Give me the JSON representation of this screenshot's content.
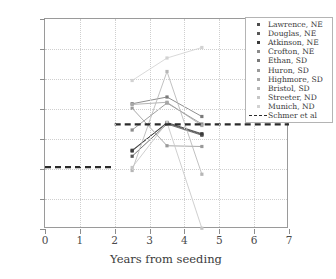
{
  "chart_data": {
    "type": "line",
    "title": "",
    "xlabel": "Years from seeding",
    "ylabel": "Harvest yield, Mg water−free/ha",
    "xlim": [
      0,
      7
    ],
    "ylim": [
      0,
      14
    ],
    "xticks": [
      "0",
      "1",
      "2",
      "3",
      "4",
      "5",
      "6",
      "7"
    ],
    "yticks": [
      "0",
      "2",
      "4",
      "6",
      "8",
      "10",
      "12",
      "14"
    ],
    "grid": true,
    "legend_position": "upper right",
    "x": [
      2.5,
      3.5,
      4.5
    ],
    "series": [
      {
        "name": "Lawrence, NE",
        "color": "#4d4d4d",
        "x": [
          2.5,
          3.5,
          4.5
        ],
        "values": [
          5.25,
          7.05,
          6.3
        ]
      },
      {
        "name": "Douglas, NE",
        "color": "#585858",
        "x": [
          2.5,
          3.5,
          4.5
        ],
        "values": [
          4.85,
          7.0,
          6.25
        ]
      },
      {
        "name": "Atkinson, NE",
        "color": "#3a3a3a",
        "x": [
          2.5,
          3.5,
          4.5
        ],
        "values": [
          5.2,
          7.1,
          6.35
        ]
      },
      {
        "name": "Crofton, NE",
        "color": "#8c8c8c",
        "x": [
          2.5,
          3.5,
          4.5
        ],
        "values": [
          6.6,
          8.4,
          7.0
        ]
      },
      {
        "name": "Ethan, SD",
        "color": "#7a7a7a",
        "x": [
          2.5,
          3.5,
          4.5
        ],
        "values": [
          8.35,
          8.8,
          7.5
        ]
      },
      {
        "name": "Huron, SD",
        "color": "#9a9a9a",
        "x": [
          2.5,
          3.5,
          4.5
        ],
        "values": [
          8.05,
          5.55,
          5.5
        ]
      },
      {
        "name": "Highmore, SD",
        "color": "#a8a8a8",
        "x": [
          2.5,
          3.5,
          4.5
        ],
        "values": [
          8.3,
          8.45,
          6.9
        ]
      },
      {
        "name": "Bristol, SD",
        "color": "#b6b6b6",
        "x": [
          2.5,
          3.5,
          4.5
        ],
        "values": [
          3.9,
          10.5,
          3.65
        ]
      },
      {
        "name": "Streeter, ND",
        "color": "#c6c6c6",
        "x": [
          2.5,
          3.5,
          4.5
        ],
        "values": [
          4.1,
          7.1,
          0.05
        ]
      },
      {
        "name": "Munich, ND",
        "color": "#d2d2d2",
        "x": [
          2.5,
          3.5,
          4.5
        ],
        "values": [
          9.9,
          11.4,
          12.1
        ]
      }
    ],
    "reference": {
      "name": "Schmer et al",
      "color": "#2b2b2b",
      "style": "dashed",
      "segments": [
        {
          "y": 4.12,
          "x_start": 0.0,
          "x_end": 2.0
        },
        {
          "y": 6.98,
          "x_start": 2.0,
          "x_end": 7.0
        }
      ]
    }
  },
  "legend": {
    "items": [
      {
        "label": "Lawrence, NE",
        "marker": "square-dot",
        "color": "#4d4d4d"
      },
      {
        "label": "Douglas, NE",
        "marker": "square-dot",
        "color": "#585858"
      },
      {
        "label": "Atkinson, NE",
        "marker": "square-dot",
        "color": "#3a3a3a"
      },
      {
        "label": "Crofton, NE",
        "marker": "square-dot",
        "color": "#8c8c8c"
      },
      {
        "label": "Ethan, SD",
        "marker": "square-dot",
        "color": "#7a7a7a"
      },
      {
        "label": "Huron, SD",
        "marker": "square-dot",
        "color": "#9a9a9a"
      },
      {
        "label": "Highmore, SD",
        "marker": "square-dot",
        "color": "#a8a8a8"
      },
      {
        "label": "Bristol, SD",
        "marker": "square-dot",
        "color": "#b6b6b6"
      },
      {
        "label": "Streeter, ND",
        "marker": "square-dot",
        "color": "#c6c6c6"
      },
      {
        "label": "Munich, ND",
        "marker": "square-dot",
        "color": "#d2d2d2"
      },
      {
        "label": "Schmer et al",
        "marker": "dashed-line",
        "color": "#2b2b2b"
      }
    ]
  }
}
